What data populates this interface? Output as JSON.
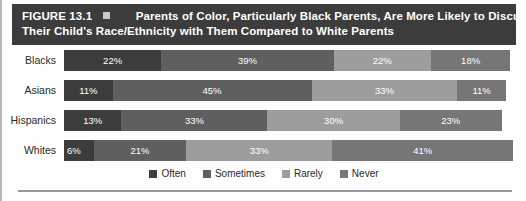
{
  "figure": {
    "number_label": "FIGURE 13.1",
    "bullet_icon": "square-bullet-icon",
    "title_line1": "Parents of Color, Particularly Black Parents, Are More Likely to Discuss",
    "title_line2": "Their Child's Race/Ethnicity with Them Compared to White Parents",
    "banner_color": "#3c3c3c",
    "banner_text_color": "#ffffff"
  },
  "chart_data": {
    "type": "bar",
    "orientation": "horizontal",
    "stacked": true,
    "normalized_percent": true,
    "title": "Parents of Color, Particularly Black Parents, Are More Likely to Discuss Their Child's Race/Ethnicity with Them Compared to White Parents",
    "xlabel": "",
    "ylabel": "",
    "xlim": [
      0,
      100
    ],
    "grid": false,
    "legend_position": "bottom-center",
    "categories": [
      "Blacks",
      "Asians",
      "Hispanics",
      "Whites"
    ],
    "series": [
      {
        "name": "Often",
        "color": "#3c3c3c",
        "values": [
          22,
          11,
          13,
          6
        ]
      },
      {
        "name": "Sometimes",
        "color": "#5f5f5f",
        "values": [
          39,
          45,
          33,
          21
        ]
      },
      {
        "name": "Rarely",
        "color": "#9d9d9d",
        "values": [
          22,
          33,
          30,
          33
        ]
      },
      {
        "name": "Never",
        "color": "#767676",
        "values": [
          18,
          11,
          23,
          41
        ]
      }
    ],
    "rows": [
      {
        "label": "Blacks",
        "segments": [
          {
            "series": "Often",
            "value": 22,
            "label": "22%",
            "color": "#3c3c3c"
          },
          {
            "series": "Sometimes",
            "value": 39,
            "label": "39%",
            "color": "#5f5f5f"
          },
          {
            "series": "Rarely",
            "value": 22,
            "label": "22%",
            "color": "#9d9d9d"
          },
          {
            "series": "Never",
            "value": 18,
            "label": "18%",
            "color": "#767676"
          }
        ]
      },
      {
        "label": "Asians",
        "segments": [
          {
            "series": "Often",
            "value": 11,
            "label": "11%",
            "color": "#3c3c3c"
          },
          {
            "series": "Sometimes",
            "value": 45,
            "label": "45%",
            "color": "#5f5f5f"
          },
          {
            "series": "Rarely",
            "value": 33,
            "label": "33%",
            "color": "#9d9d9d"
          },
          {
            "series": "Never",
            "value": 11,
            "label": "11%",
            "color": "#767676"
          }
        ]
      },
      {
        "label": "Hispanics",
        "segments": [
          {
            "series": "Often",
            "value": 13,
            "label": "13%",
            "color": "#3c3c3c"
          },
          {
            "series": "Sometimes",
            "value": 33,
            "label": "33%",
            "color": "#5f5f5f"
          },
          {
            "series": "Rarely",
            "value": 30,
            "label": "30%",
            "color": "#9d9d9d"
          },
          {
            "series": "Never",
            "value": 23,
            "label": "23%",
            "color": "#767676"
          }
        ]
      },
      {
        "label": "Whites",
        "segments": [
          {
            "series": "Often",
            "value": 6,
            "label": "6%",
            "color": "#3c3c3c"
          },
          {
            "series": "Sometimes",
            "value": 21,
            "label": "21%",
            "color": "#5f5f5f"
          },
          {
            "series": "Rarely",
            "value": 33,
            "label": "33%",
            "color": "#9d9d9d"
          },
          {
            "series": "Never",
            "value": 41,
            "label": "41%",
            "color": "#767676"
          }
        ]
      }
    ],
    "legend": [
      {
        "label": "Often",
        "color": "#3c3c3c"
      },
      {
        "label": "Sometimes",
        "color": "#5f5f5f"
      },
      {
        "label": "Rarely",
        "color": "#9d9d9d"
      },
      {
        "label": "Never",
        "color": "#767676"
      }
    ]
  }
}
